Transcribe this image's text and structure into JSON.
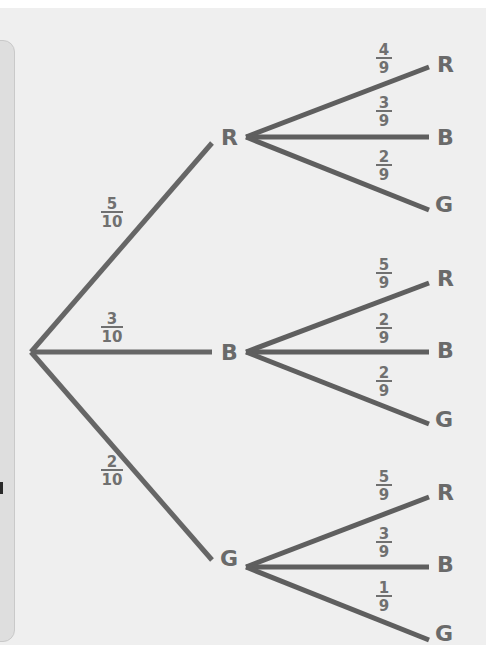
{
  "diagram": {
    "type": "probability-tree",
    "colors": {
      "background": "#efefef",
      "line": "#666666",
      "text": "#6a6a6a"
    },
    "root": {
      "x": 31,
      "y": 352
    },
    "level1": [
      {
        "label": "R",
        "probability": {
          "num": "5",
          "den": "10"
        },
        "line_end": {
          "x": 212,
          "y": 143
        },
        "label_pos": {
          "x": 221,
          "y": 145
        },
        "frac_pos": {
          "x": 112,
          "y": 212
        },
        "children_origin": {
          "x": 246,
          "y": 137
        },
        "children": [
          {
            "label": "R",
            "probability": {
              "num": "4",
              "den": "9"
            },
            "line_end": {
              "x": 429,
              "y": 67
            },
            "label_pos": {
              "x": 437,
              "y": 72
            },
            "frac_pos": {
              "x": 384,
              "y": 58
            }
          },
          {
            "label": "B",
            "probability": {
              "num": "3",
              "den": "9"
            },
            "line_end": {
              "x": 429,
              "y": 137
            },
            "label_pos": {
              "x": 437,
              "y": 145
            },
            "frac_pos": {
              "x": 384,
              "y": 111
            }
          },
          {
            "label": "G",
            "probability": {
              "num": "2",
              "den": "9"
            },
            "line_end": {
              "x": 429,
              "y": 210
            },
            "label_pos": {
              "x": 435,
              "y": 212
            },
            "frac_pos": {
              "x": 384,
              "y": 165
            }
          }
        ]
      },
      {
        "label": "B",
        "probability": {
          "num": "3",
          "den": "10"
        },
        "line_end": {
          "x": 212,
          "y": 352
        },
        "label_pos": {
          "x": 221,
          "y": 360
        },
        "frac_pos": {
          "x": 112,
          "y": 327
        },
        "children_origin": {
          "x": 246,
          "y": 352
        },
        "children": [
          {
            "label": "R",
            "probability": {
              "num": "5",
              "den": "9"
            },
            "line_end": {
              "x": 429,
              "y": 283
            },
            "label_pos": {
              "x": 437,
              "y": 286
            },
            "frac_pos": {
              "x": 384,
              "y": 273
            }
          },
          {
            "label": "B",
            "probability": {
              "num": "2",
              "den": "9"
            },
            "line_end": {
              "x": 429,
              "y": 352
            },
            "label_pos": {
              "x": 437,
              "y": 358
            },
            "frac_pos": {
              "x": 384,
              "y": 328
            }
          },
          {
            "label": "G",
            "probability": {
              "num": "2",
              "den": "9"
            },
            "line_end": {
              "x": 429,
              "y": 424
            },
            "label_pos": {
              "x": 435,
              "y": 427
            },
            "frac_pos": {
              "x": 384,
              "y": 381
            }
          }
        ]
      },
      {
        "label": "G",
        "probability": {
          "num": "2",
          "den": "10"
        },
        "line_end": {
          "x": 212,
          "y": 560
        },
        "label_pos": {
          "x": 220,
          "y": 566
        },
        "frac_pos": {
          "x": 112,
          "y": 470
        },
        "children_origin": {
          "x": 246,
          "y": 567
        },
        "children": [
          {
            "label": "R",
            "probability": {
              "num": "5",
              "den": "9"
            },
            "line_end": {
              "x": 429,
              "y": 497
            },
            "label_pos": {
              "x": 437,
              "y": 500
            },
            "frac_pos": {
              "x": 384,
              "y": 485
            }
          },
          {
            "label": "B",
            "probability": {
              "num": "3",
              "den": "9"
            },
            "line_end": {
              "x": 429,
              "y": 567
            },
            "label_pos": {
              "x": 437,
              "y": 572
            },
            "frac_pos": {
              "x": 384,
              "y": 542
            }
          },
          {
            "label": "G",
            "probability": {
              "num": "1",
              "den": "9"
            },
            "line_end": {
              "x": 429,
              "y": 640
            },
            "label_pos": {
              "x": 435,
              "y": 641
            },
            "frac_pos": {
              "x": 384,
              "y": 596
            }
          }
        ]
      }
    ]
  }
}
